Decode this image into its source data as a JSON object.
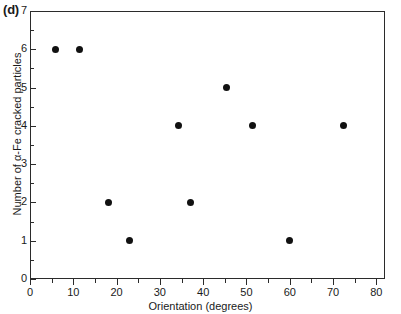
{
  "figure": {
    "panel_label": "(d)"
  },
  "chart_data": {
    "type": "scatter",
    "title": "",
    "xlabel": "Orientation (degrees)",
    "ylabel": "Number of α-Fe cracked particles",
    "xlim": [
      0,
      82
    ],
    "ylim": [
      0,
      7
    ],
    "grid": false,
    "legend": null,
    "marker": {
      "shape": "circle",
      "color": "#111111",
      "size_px": 7
    },
    "x_ticks_major": [
      0,
      10,
      20,
      30,
      40,
      50,
      60,
      70,
      80
    ],
    "x_tick_labels": [
      "0",
      "10",
      "20",
      "30",
      "40",
      "50",
      "60",
      "70",
      "80"
    ],
    "x_ticks_minor": [
      5,
      15,
      25,
      35,
      45,
      55,
      65,
      75
    ],
    "y_ticks_major": [
      0,
      1,
      2,
      3,
      4,
      5,
      6,
      7
    ],
    "y_tick_labels": [
      "0",
      "1",
      "2",
      "3",
      "4",
      "5",
      "6",
      "7"
    ],
    "y_ticks_minor": [
      0.5,
      1.5,
      2.5,
      3.5,
      4.5,
      5.5,
      6.5
    ],
    "points": [
      {
        "x": 5.8,
        "y": 6
      },
      {
        "x": 11.5,
        "y": 6
      },
      {
        "x": 18.2,
        "y": 2
      },
      {
        "x": 22.9,
        "y": 1
      },
      {
        "x": 34.4,
        "y": 4
      },
      {
        "x": 37.0,
        "y": 2
      },
      {
        "x": 45.3,
        "y": 5
      },
      {
        "x": 51.5,
        "y": 4
      },
      {
        "x": 60.0,
        "y": 1
      },
      {
        "x": 72.3,
        "y": 4
      }
    ]
  }
}
